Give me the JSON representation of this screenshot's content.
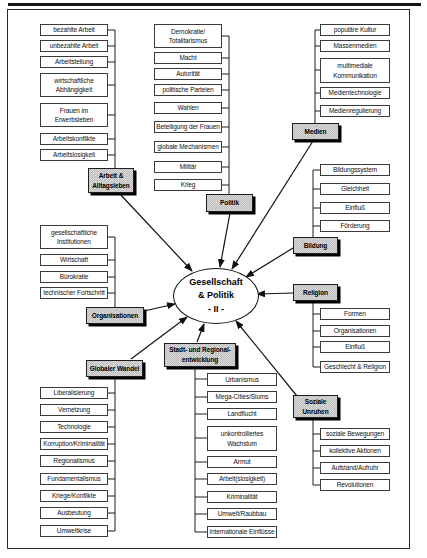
{
  "center": {
    "title": "Gesellschaft\n& Politik\n- II -"
  },
  "groups": {
    "arbeit": {
      "label": "Arbeit &\nAlltagsleben",
      "items": [
        "bezahlte Arbeit",
        "unbezahlte Arbeit",
        "Arbeitsteilung",
        "wirtschaftliche\nAbhängigkeit",
        "Frauen im\nErwerbsleben",
        "Arbeitskonflikte",
        "Arbeitslosigkeit"
      ]
    },
    "politik": {
      "label": "Politik",
      "items": [
        "Demokratie/\nTotalitarismus",
        "Macht",
        "Autorität",
        "politische Parteien",
        "Wahlen",
        "Beteiligung der Frauen",
        "globale Mechanismen",
        "Militär",
        "Krieg"
      ]
    },
    "medien": {
      "label": "Medien",
      "items": [
        "populäre Kultur",
        "Massenmedien",
        "multimediale\nKommunikation",
        "Medientechnologie",
        "Medienregulierung"
      ]
    },
    "bildung": {
      "label": "Bildung",
      "items": [
        "Bildungssystem",
        "Gleichheit",
        "Einfluß",
        "Förderung"
      ]
    },
    "religion": {
      "label": "Religion",
      "items": [
        "Formen",
        "Organisationen",
        "Einfluß",
        "Geschlecht & Religion"
      ]
    },
    "soziale_unruhen": {
      "label": "Soziale\nUnruhen",
      "items": [
        "soziale Bewegungen",
        "kollektive Aktionen",
        "Aufstand/Aufruhr",
        "Revolutionen"
      ]
    },
    "organisationen": {
      "label": "Organisationen",
      "items": [
        "gesellschaftliche\nInstitutionen",
        "Wirtschaft",
        "Bürokratie",
        "technischer Fortschritt"
      ]
    },
    "globaler_wandel": {
      "label": "Globaler Wandel",
      "items": [
        "Liberalisierung",
        "Vernetzung",
        "Technologie",
        "Korruption/Kriminalität",
        "Regionalismus",
        "Fundamentalismus",
        "Kriege/Konflikte",
        "Ausbeutung",
        "Umweltkrise"
      ]
    },
    "stadt": {
      "label": "Stadt- und Regional-\nentwicklung",
      "items": [
        "Urbanismus",
        "Mega-Cities/Slums",
        "Landflucht",
        "unkontrolliertes\nWachstum",
        "Armut",
        "Arbeit(slosigkeit)",
        "Kriminalität",
        "Umwelt/Raubbau",
        "internationale Einflüsse"
      ]
    }
  },
  "colors": {
    "category_fill": "#c9c9c9",
    "category_fill_alt": "#dadada",
    "box_border": "#3a3a3a",
    "line": "#1c1c1c",
    "background": "#ffffff"
  }
}
